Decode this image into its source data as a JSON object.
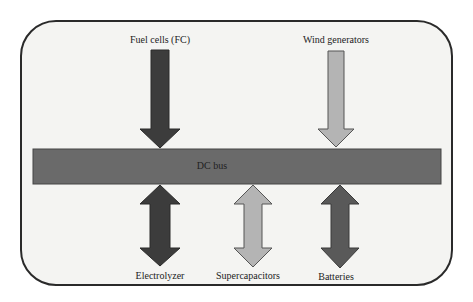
{
  "diagram": {
    "bus": {
      "label": "DC bus",
      "color": "#6a6a6a"
    },
    "sources": [
      {
        "label": "Fuel cells (FC)",
        "direction": "into-bus",
        "color": "#3c3c3c"
      },
      {
        "label": "Wind generators",
        "direction": "into-bus",
        "color": "#b4b4b4"
      }
    ],
    "loads": [
      {
        "label": "Electrolyzer",
        "direction": "bidirectional",
        "color": "#3c3c3c"
      },
      {
        "label": "Supercapacitors",
        "direction": "bidirectional",
        "color": "#b4b4b4"
      },
      {
        "label": "Batteries",
        "direction": "bidirectional",
        "color": "#595959"
      }
    ]
  }
}
